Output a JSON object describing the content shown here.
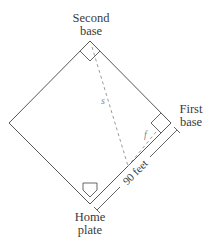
{
  "diagram": {
    "type": "baseball-diamond",
    "labels": {
      "second_base": [
        "Second",
        "base"
      ],
      "first_base": [
        "First",
        "base"
      ],
      "home_plate": [
        "Home",
        "plate"
      ]
    },
    "distance_label": "90 feet",
    "variables": {
      "s": "s",
      "f": "f"
    },
    "geometry": {
      "left": [
        9,
        123
      ],
      "top": [
        90,
        41
      ],
      "right": [
        171,
        123
      ],
      "bottom": [
        90,
        204
      ]
    },
    "colors": {
      "line": "#555555",
      "dashed": "#9a9a9a",
      "text": "#3a3a3a"
    }
  }
}
